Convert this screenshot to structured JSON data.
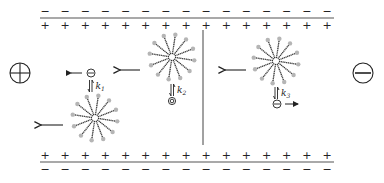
{
  "diagram": {
    "type": "micellar-electrokinetic-schematic",
    "colors": {
      "ink": "#222222",
      "plate_line": "#555555",
      "head_group": "#b5b5b5",
      "tail": "#333333"
    },
    "top_wall": {
      "outer_charge": "−",
      "inner_charge": "+",
      "count": 15
    },
    "bottom_wall": {
      "inner_charge": "+",
      "outer_charge": "−",
      "count": 15
    },
    "electrodes": {
      "anode_symbol": "⊕",
      "cathode_symbol": "⊖",
      "anode_side": "left",
      "cathode_side": "right"
    },
    "equilibria": [
      {
        "label": "k",
        "subscript": "1",
        "species": "anion",
        "species_symbol": "⊖",
        "migration": "left"
      },
      {
        "label": "k",
        "subscript": "2",
        "species": "neutral",
        "species_symbol": "◎",
        "migration": "none"
      },
      {
        "label": "k",
        "subscript": "3",
        "species": "anion",
        "species_symbol": "⊖",
        "migration": "right"
      }
    ],
    "micelles": [
      {
        "id": "micelle-1",
        "region": "left",
        "migration": "left"
      },
      {
        "id": "micelle-2",
        "region": "left",
        "migration": "left"
      },
      {
        "id": "micelle-3",
        "region": "right",
        "migration": "left"
      }
    ]
  }
}
